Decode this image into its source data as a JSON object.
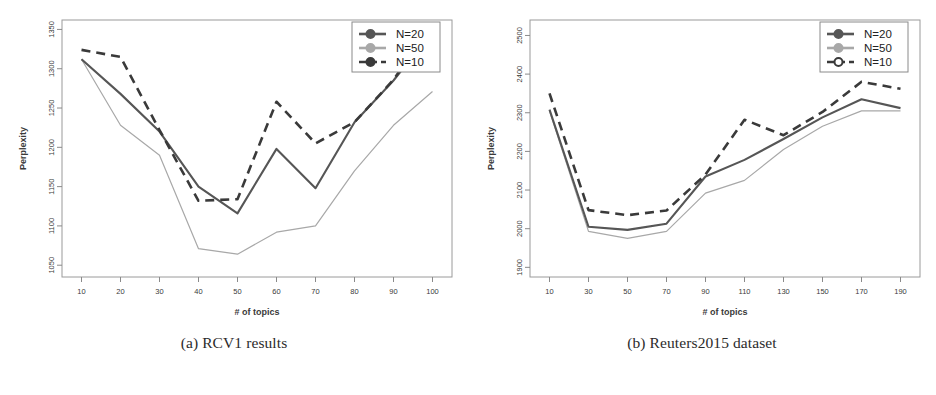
{
  "figure": {
    "subfigures": [
      {
        "id": "rcv1",
        "caption": "(a) RCV1 results",
        "chart_index": 0
      },
      {
        "id": "reuters2015",
        "caption": "(b) Reuters2015 dataset",
        "chart_index": 1
      }
    ]
  },
  "colors": {
    "dark": "#3a3a3a",
    "mid_gray": "#6e6e6e",
    "light_gray": "#a8a8a8",
    "axis": "#8a8a8a",
    "frame": "#9a9a9a",
    "legend_border": "#8a8a8a",
    "text": "#3a3a3a",
    "background": "#ffffff"
  },
  "chart_data": [
    {
      "type": "line",
      "title": "",
      "subtitle": "",
      "xlabel": "# of topics",
      "ylabel": "Perplexity",
      "grid": false,
      "legend_position": "top-right",
      "legend_entries": [
        "N=20",
        "N=50",
        "N=10"
      ],
      "x": [
        10,
        20,
        30,
        40,
        50,
        60,
        70,
        80,
        90,
        100
      ],
      "xticks": [
        10,
        20,
        30,
        40,
        50,
        60,
        70,
        80,
        90,
        100
      ],
      "xticklabels": [
        "10",
        "20",
        "30",
        "40",
        "50",
        "60",
        "70",
        "80",
        "90",
        "100"
      ],
      "yticks": [
        1050,
        1100,
        1150,
        1200,
        1250,
        1300,
        1350
      ],
      "yticklabels": [
        "1050",
        "1100",
        "1150",
        "1200",
        "1250",
        "1300",
        "1350"
      ],
      "xlim": [
        5,
        105
      ],
      "ylim": [
        1035,
        1362
      ],
      "series": [
        {
          "name": "N=20",
          "style": "solid",
          "color": "#565656",
          "width": 2.1,
          "values": [
            1312,
            1268,
            1220,
            1150,
            1116,
            1198,
            1148,
            1232,
            1285,
            1348
          ]
        },
        {
          "name": "N=50",
          "style": "solid",
          "color": "#a8a8a8",
          "width": 1.2,
          "values": [
            1312,
            1228,
            1190,
            1071,
            1064,
            1092,
            1100,
            1170,
            1228,
            1271
          ]
        },
        {
          "name": "N=10",
          "style": "dashed",
          "color": "#3a3a3a",
          "width": 2.6,
          "values": [
            1324,
            1315,
            1222,
            1132,
            1134,
            1258,
            1205,
            1232,
            1286,
            1357
          ]
        }
      ]
    },
    {
      "type": "line",
      "title": "",
      "subtitle": "",
      "xlabel": "# of topics",
      "ylabel": "Perplexity",
      "grid": false,
      "legend_position": "top-right",
      "legend_entries": [
        "N=20",
        "N=50",
        "N=10"
      ],
      "x": [
        10,
        30,
        50,
        70,
        90,
        110,
        130,
        150,
        170,
        190
      ],
      "xticks": [
        10,
        30,
        50,
        70,
        90,
        110,
        130,
        150,
        170,
        190
      ],
      "xticklabels": [
        "10",
        "30",
        "50",
        "70",
        "90",
        "110",
        "130",
        "150",
        "170",
        "190"
      ],
      "yticks": [
        1900,
        2000,
        2100,
        2200,
        2300,
        2400,
        2500
      ],
      "yticklabels": [
        "1900",
        "2000",
        "2100",
        "2200",
        "2300",
        "2400",
        "2500"
      ],
      "xlim": [
        0,
        200
      ],
      "ylim": [
        1875,
        2540
      ],
      "series": [
        {
          "name": "N=20",
          "style": "solid",
          "color": "#565656",
          "width": 2.1,
          "values": [
            2308,
            2005,
            1997,
            2013,
            2135,
            2178,
            2232,
            2288,
            2335,
            2312
          ]
        },
        {
          "name": "N=50",
          "style": "solid",
          "color": "#a8a8a8",
          "width": 1.2,
          "values": [
            2305,
            1993,
            1975,
            1993,
            2092,
            2125,
            2205,
            2265,
            2305,
            2305
          ]
        },
        {
          "name": "N=10",
          "style": "dashed",
          "color": "#3a3a3a",
          "width": 2.6,
          "values": [
            2350,
            2048,
            2035,
            2047,
            2140,
            2282,
            2242,
            2302,
            2380,
            2362
          ]
        }
      ]
    }
  ]
}
